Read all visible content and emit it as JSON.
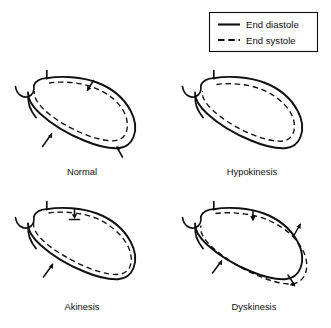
{
  "figure": {
    "background_color": "#ffffff",
    "line_color": "#101010",
    "width": 331,
    "height": 328
  },
  "legend": {
    "position": "top-right",
    "entries": [
      {
        "label": "End diastole",
        "line_style": "solid",
        "color": "#101010"
      },
      {
        "label": "End systole",
        "line_style": "dashed",
        "color": "#101010"
      }
    ]
  },
  "panels": [
    {
      "id": "normal",
      "caption": "Normal",
      "row": 0,
      "column": 0,
      "arrows": [
        {
          "name": "anterior-wall-inward-arrow",
          "direction": "down-left",
          "region": "anterior wall"
        },
        {
          "name": "inferior-wall-inward-arrow",
          "direction": "up-right",
          "region": "inferior wall"
        },
        {
          "name": "apical-inward-arrow",
          "direction": "down-right",
          "region": "apex"
        }
      ]
    },
    {
      "id": "hypokinesis",
      "caption": "Hypokinesis",
      "row": 0,
      "column": 1,
      "arrows": []
    },
    {
      "id": "akinesis",
      "caption": "Akinesis",
      "row": 1,
      "column": 0,
      "arrows": [
        {
          "name": "anterior-wall-no-motion-arrow",
          "direction": "down",
          "region": "anterior wall"
        },
        {
          "name": "inferior-wall-inward-arrow",
          "direction": "up-right",
          "region": "inferior wall"
        }
      ]
    },
    {
      "id": "dyskinesis",
      "caption": "Dyskinesis",
      "row": 1,
      "column": 1,
      "arrows": [
        {
          "name": "anterior-wall-inward-arrow",
          "direction": "down",
          "region": "anterior wall"
        },
        {
          "name": "lateral-wall-outward-arrow",
          "direction": "up-right",
          "region": "lateral wall"
        },
        {
          "name": "inferior-wall-inward-arrow",
          "direction": "up-right",
          "region": "inferior wall"
        },
        {
          "name": "apical-outward-arrow",
          "direction": "down-right",
          "region": "apex"
        }
      ]
    }
  ]
}
